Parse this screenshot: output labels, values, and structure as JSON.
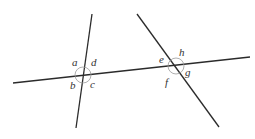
{
  "diagram": {
    "colors": {
      "line": "#2b2b2b",
      "arc": "#9a9a9a",
      "label": "#333333",
      "background": "#ffffff"
    },
    "transversal": {
      "x1": 13,
      "y1": 83,
      "x2": 250,
      "y2": 57
    },
    "line1": {
      "x1": 92,
      "y1": 14,
      "x2": 76,
      "y2": 128
    },
    "line2": {
      "x1": 137,
      "y1": 14,
      "x2": 219,
      "y2": 127
    },
    "intersection1": {
      "cx": 83,
      "cy": 75,
      "r": 8,
      "labels": [
        {
          "text": "a",
          "x": 72,
          "y": 66
        },
        {
          "text": "d",
          "x": 91,
          "y": 66
        },
        {
          "text": "b",
          "x": 70,
          "y": 89
        },
        {
          "text": "c",
          "x": 90,
          "y": 88
        }
      ]
    },
    "intersection2": {
      "cx": 176,
      "cy": 66,
      "r": 8,
      "labels": [
        {
          "text": "e",
          "x": 159,
          "y": 63
        },
        {
          "text": "h",
          "x": 179,
          "y": 56
        },
        {
          "text": "g",
          "x": 185,
          "y": 76
        },
        {
          "text": "f",
          "x": 165,
          "y": 86
        }
      ]
    }
  }
}
